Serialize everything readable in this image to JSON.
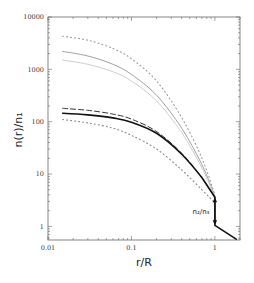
{
  "chart_data": {
    "type": "line",
    "title": "",
    "xlabel": "r/R",
    "ylabel": "n(r)/n₁",
    "xscale": "log",
    "yscale": "log",
    "xlim": [
      0.01,
      2.0
    ],
    "ylim": [
      0.55,
      10000
    ],
    "x_ticks": [
      0.01,
      0.1,
      1
    ],
    "x_tick_labels": [
      "0.01",
      "0.1",
      "1"
    ],
    "y_ticks": [
      1,
      10,
      100,
      1000,
      10000
    ],
    "y_tick_labels": [
      "1",
      "10",
      "100",
      "1000",
      "10000"
    ],
    "grid": false,
    "legend": null,
    "series": [
      {
        "name": "gray-dotted-top",
        "style": "dotted",
        "color": "#9a9a9a",
        "x": [
          0.015,
          0.03,
          0.06,
          0.1,
          0.2,
          0.4,
          0.7,
          1.0
        ],
        "y": [
          4300,
          3600,
          2500,
          1600,
          600,
          120,
          20,
          4
        ]
      },
      {
        "name": "gray-solid",
        "style": "solid",
        "color": "#a0a0a0",
        "x": [
          0.015,
          0.03,
          0.06,
          0.1,
          0.2,
          0.4,
          0.7,
          1.0
        ],
        "y": [
          2200,
          1800,
          1250,
          800,
          320,
          75,
          15,
          3.8
        ]
      },
      {
        "name": "gray-light-solid",
        "style": "solid",
        "color": "#cfcfcf",
        "x": [
          0.015,
          0.03,
          0.06,
          0.1,
          0.2,
          0.4,
          0.7,
          1.0
        ],
        "y": [
          1500,
          1250,
          900,
          600,
          250,
          62,
          13,
          3.6
        ]
      },
      {
        "name": "black-dashed",
        "style": "dashed",
        "color": "#333333",
        "x": [
          0.015,
          0.03,
          0.06,
          0.1,
          0.2,
          0.4,
          0.7,
          1.0
        ],
        "y": [
          180,
          165,
          140,
          112,
          65,
          25,
          8.5,
          3.6
        ]
      },
      {
        "name": "black-solid",
        "style": "solid",
        "color": "#111111",
        "x": [
          0.015,
          0.03,
          0.06,
          0.1,
          0.2,
          0.4,
          0.7,
          1.0,
          1.0,
          1.8
        ],
        "y": [
          145,
          135,
          118,
          98,
          60,
          24,
          8.5,
          3.6,
          1.05,
          0.57
        ]
      },
      {
        "name": "gray-dotted-bottom",
        "style": "dotted",
        "color": "#888888",
        "x": [
          0.015,
          0.03,
          0.06,
          0.1,
          0.2,
          0.4,
          0.7,
          1.0
        ],
        "y": [
          110,
          95,
          75,
          55,
          30,
          12,
          5,
          2.8
        ]
      }
    ],
    "annotations": [
      {
        "text": "n₂/n₃",
        "x": 0.7,
        "y": 1.9,
        "type": "double-arrow",
        "arrow_from": [
          1.0,
          3.6
        ],
        "arrow_to": [
          1.0,
          1.05
        ]
      }
    ]
  }
}
